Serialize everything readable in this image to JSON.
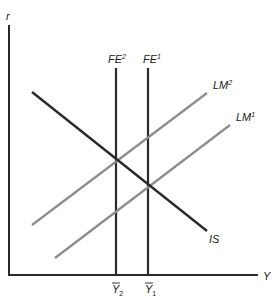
{
  "diagram": {
    "type": "IS-LM-FE",
    "axes": {
      "y_label": "r",
      "x_label": "Y",
      "color": "#2a2a2a"
    },
    "curves": {
      "fe2": {
        "label": "FE",
        "sup": "2",
        "color": "#2a2a2a"
      },
      "fe1": {
        "label": "FE",
        "sup": "1",
        "color": "#2a2a2a"
      },
      "lm2": {
        "label": "LM",
        "sup": "2",
        "color": "#8c8c8c"
      },
      "lm1": {
        "label": "LM",
        "sup": "1",
        "color": "#8c8c8c"
      },
      "is": {
        "label": "IS",
        "color": "#2a2a2a"
      }
    },
    "ticks": {
      "y2": {
        "label": "Y",
        "sub": "2"
      },
      "y1": {
        "label": "Y",
        "sub": "1"
      }
    }
  }
}
